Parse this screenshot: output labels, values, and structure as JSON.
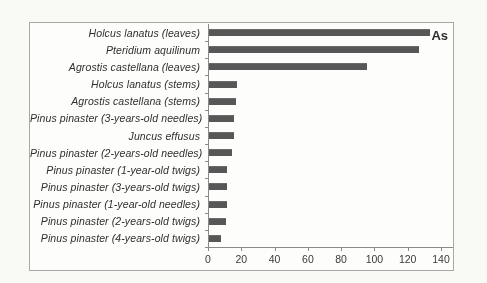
{
  "figure": {
    "kind": "scanned-journal-figure",
    "element_symbol": "As"
  },
  "chart_data": {
    "type": "bar",
    "orientation": "horizontal",
    "title": "As",
    "categories": [
      "Holcus lanatus (leaves)",
      "Pteridium aquilinum",
      "Agrostis castellana (leaves)",
      "Holcus lanatus (stems)",
      "Agrostis castellana (stems)",
      "Pinus pinaster (3-years-old needles)",
      "Juncus effusus",
      "Pinus pinaster (2-years-old needles)",
      "Pinus pinaster (1-year-old twigs)",
      "Pinus pinaster (3-years-old twigs)",
      "Pinus pinaster (1-year-old needles)",
      "Pinus pinaster (2-years-old twigs)",
      "Pinus pinaster (4-years-old twigs)"
    ],
    "values": [
      133,
      126,
      95,
      17,
      16,
      15,
      15,
      14,
      11,
      11,
      11,
      10,
      7
    ],
    "xlabel": "",
    "ylabel": "",
    "xlim": [
      0,
      140
    ],
    "xticks": [
      0,
      20,
      40,
      60,
      80,
      100,
      120,
      140
    ],
    "grid": false,
    "legend": false,
    "label_style": "italic",
    "bar_color": "#575757",
    "axis_color": "#8a8a86"
  }
}
